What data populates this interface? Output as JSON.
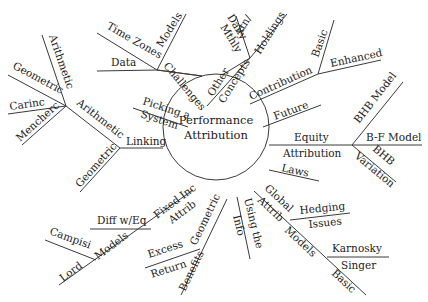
{
  "diagram": {
    "type": "mind-map",
    "center": {
      "line1": "Performance",
      "line2": "Attribution"
    },
    "branches": {
      "linking": {
        "label": "Linking",
        "arithmetic": {
          "label": "Arithmetic",
          "children": [
            "Arithmetic",
            "Geometric",
            "Carinc",
            "Mencherc"
          ]
        },
        "geometric": {
          "label": "Geometric"
        }
      },
      "picking": {
        "line1": "Picking a",
        "line2": "System"
      },
      "challenges": {
        "label": "Challenges",
        "children": [
          "Models",
          "Time Zones",
          "Data"
        ]
      },
      "concepts": {
        "label": "Concepts",
        "other": "Other",
        "holdings": "Holdings",
        "daily_top": "Daily/ xtn/",
        "daily_bottom": "Mthly",
        "daily_a": "Daily",
        "daily_b": "xtn/"
      },
      "contribution": {
        "label": "Contribution",
        "children": [
          "Basic",
          "Enhanced"
        ]
      },
      "future": {
        "label": "Future"
      },
      "equity": {
        "line1": "Equity",
        "line2": "Attribution",
        "children": [
          "BHB Model",
          "B-F Model",
          "BHB",
          "Variation"
        ]
      },
      "laws": {
        "label": "Laws"
      },
      "global": {
        "line1": "Global",
        "line2": "Attrib",
        "line3": "Models",
        "hedging_top": "Hedging",
        "hedging_bottom": "Issues",
        "karnosky_top": "Karnosky",
        "karnosky_bottom": "Singer",
        "basic": "Basic"
      },
      "using": {
        "line1": "Using the",
        "line2": "Info"
      },
      "geometric_benefits": {
        "label": "Geometric",
        "benefits": "Benefits",
        "excess_top": "Excess",
        "excess_bottom": "Return"
      },
      "fixed_income": {
        "line1": "Fixed Inc",
        "line2": "Attrib",
        "diff": "Diff w/Eq",
        "models": "Models",
        "campisi": "Campisi",
        "lord": "Lord"
      }
    }
  }
}
